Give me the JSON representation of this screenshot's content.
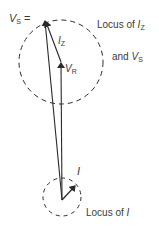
{
  "diagram": {
    "type": "phasor-diagram",
    "colors": {
      "stroke": "#2a2a2a",
      "text": "#3a3a3a",
      "background": "#ffffff"
    },
    "labels": {
      "vs_label": {
        "symbol": "V",
        "subscript": "S",
        "suffix": " ="
      },
      "iz_label": {
        "symbol": "I",
        "subscript": "Z"
      },
      "vr_label": {
        "symbol": "V",
        "subscript": "R"
      },
      "i_label": {
        "symbol": "I"
      },
      "locus_iz_line1_text": "Locus of ",
      "locus_iz_line1_symbol": "I",
      "locus_iz_line1_subscript": "Z",
      "locus_iz_line2_text": "and ",
      "locus_iz_line2_symbol": "V",
      "locus_iz_line2_subscript": "S",
      "locus_i_text": "Locus of ",
      "locus_i_symbol": "I"
    },
    "geometry": {
      "origin": [
        62,
        200
      ],
      "vs_tip": [
        45,
        20
      ],
      "vr_tip": [
        61,
        62
      ],
      "i_tip": [
        75,
        185
      ],
      "large_circle": {
        "cx": 61,
        "cy": 62,
        "r": 42,
        "dashed": true
      },
      "small_circle": {
        "cx": 62,
        "cy": 197,
        "r": 19,
        "dashed": true
      }
    }
  }
}
